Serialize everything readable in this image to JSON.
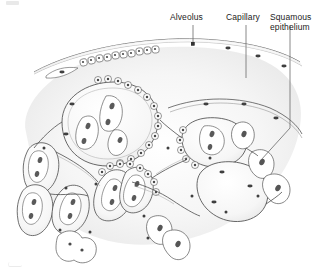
{
  "figure": {
    "background_color": "#ffffff",
    "ink_color": "#3a3a3a",
    "nucleus_color": "#4a4a4a",
    "tissue_shade_color": "#ededed",
    "leader_line_color": "#5a5a5a"
  },
  "labels": [
    {
      "id": "alveolus",
      "text": "Alveolus",
      "x": 170,
      "y": 13,
      "leader": {
        "type": "vertical",
        "x": 193,
        "y_start": 24,
        "y_end": 44,
        "terminator": "square-marker"
      }
    },
    {
      "id": "capillary",
      "text": "Capillary",
      "x": 226,
      "y": 13,
      "leader": {
        "type": "vertical",
        "x": 246,
        "y_start": 24,
        "y_end": 78,
        "terminator": "none"
      }
    },
    {
      "id": "squamous-epithelium",
      "text": "Squamous\nepithelium",
      "line1": "Squamous",
      "line2": "epithelium",
      "x": 270,
      "y": 13,
      "leader": {
        "type": "elbow",
        "x": 290,
        "y_start": 24,
        "y_end": 128,
        "bend_to_x": 261,
        "bend_to_y": 160
      }
    }
  ],
  "structures": [
    {
      "name": "alveolar-duct-lining",
      "description": "thin membrane band with row of cuboidal cells across upper field"
    },
    {
      "name": "alveolus-lumen",
      "description": "open air spaces bounded by thin alveolar walls"
    },
    {
      "name": "capillary",
      "description": "vessel profile running within the alveolar septum"
    },
    {
      "name": "squamous-epithelial-cell",
      "description": "flattened cell with elongated nucleus lining alveolar surface"
    },
    {
      "name": "cuboidal-cell-row",
      "description": "beaded row of small rounded cells along septal borders"
    },
    {
      "name": "alveolar-septum",
      "description": "connective tissue partitions between adjacent alveoli"
    }
  ],
  "corner_marks": [
    {
      "id": "top-left-mark"
    },
    {
      "id": "bottom-left-mark"
    }
  ]
}
